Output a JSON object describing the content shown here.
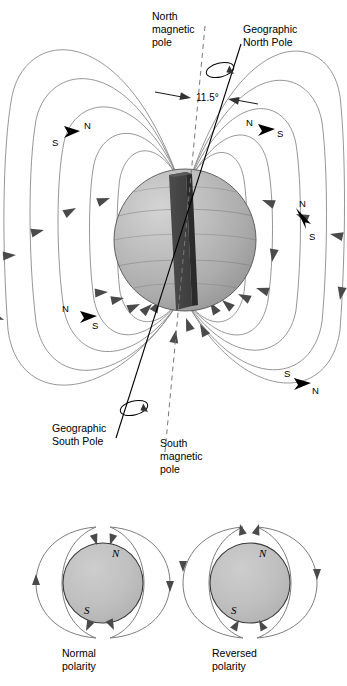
{
  "figure": {
    "background_color": "#ffffff",
    "globe_fill": "#b3b3b3",
    "magnet_color": "#3a3a3a",
    "fieldline_color": "#8a8a8a",
    "arrow_color": "#4a4a4a"
  },
  "main": {
    "labels": {
      "north_magnetic_pole": "North\nmagnetic\npole",
      "north_magnetic_pole_lines": [
        "North",
        "magnetic",
        "pole"
      ],
      "geographic_north_pole": "Geographic\nNorth Pole",
      "geographic_north_pole_lines": [
        "Geographic",
        "North Pole"
      ],
      "geographic_south_pole_lines": [
        "Geographic",
        "South Pole"
      ],
      "south_magnetic_pole_lines": [
        "South",
        "magnetic",
        "pole"
      ],
      "tilt_angle": "11.5°"
    },
    "compasses": [
      {
        "id": "upper-left",
        "north_label": "N",
        "south_label": "S"
      },
      {
        "id": "upper-right",
        "north_label": "N",
        "south_label": "S"
      },
      {
        "id": "right",
        "north_label": "N",
        "south_label": "S"
      },
      {
        "id": "lower-left",
        "north_label": "N",
        "south_label": "S"
      },
      {
        "id": "lower-right",
        "north_label": "N",
        "south_label": "S"
      }
    ]
  },
  "polarity": {
    "normal": {
      "caption_lines": [
        "Normal",
        "polarity"
      ],
      "north_label": "N",
      "south_label": "S",
      "field_direction": "into-north-pole"
    },
    "reversed": {
      "caption_lines": [
        "Reversed",
        "polarity"
      ],
      "north_label": "N",
      "south_label": "S",
      "field_direction": "out-of-north-pole"
    }
  }
}
